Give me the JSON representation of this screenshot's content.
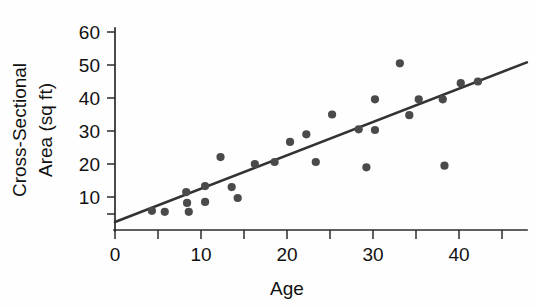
{
  "chart_data": {
    "type": "scatter",
    "title": "",
    "xlabel": "Age",
    "ylabel": "Cross-Sectional Area (sq ft)",
    "ylabel_line1": "Cross-Sectional",
    "ylabel_line2": "Area (sq ft)",
    "xlim": [
      0,
      48
    ],
    "ylim": [
      0,
      65
    ],
    "grid": false,
    "legend": null,
    "x_ticks_labeled": [
      0,
      10,
      20,
      30,
      40
    ],
    "x_ticks_minor": [
      5,
      15,
      25,
      35,
      45
    ],
    "y_ticks_labeled": [
      10,
      20,
      30,
      40,
      50,
      60
    ],
    "y_ticks_minor": [
      5
    ],
    "marker_color": "#4a4a4a",
    "line_color": "#333333",
    "axis_color": "#2b2b2b",
    "points": [
      {
        "x": 4.3,
        "y": 5.8
      },
      {
        "x": 5.8,
        "y": 5.5
      },
      {
        "x": 8.3,
        "y": 11.5
      },
      {
        "x": 8.4,
        "y": 8.2
      },
      {
        "x": 8.6,
        "y": 5.5
      },
      {
        "x": 10.5,
        "y": 13.3
      },
      {
        "x": 10.5,
        "y": 8.5
      },
      {
        "x": 12.3,
        "y": 22.1
      },
      {
        "x": 13.6,
        "y": 13.0
      },
      {
        "x": 14.3,
        "y": 9.7
      },
      {
        "x": 16.3,
        "y": 20.0
      },
      {
        "x": 18.6,
        "y": 20.6
      },
      {
        "x": 20.4,
        "y": 26.7
      },
      {
        "x": 22.3,
        "y": 29.0
      },
      {
        "x": 23.4,
        "y": 20.6
      },
      {
        "x": 25.3,
        "y": 35.0
      },
      {
        "x": 28.4,
        "y": 30.5
      },
      {
        "x": 29.3,
        "y": 19.0
      },
      {
        "x": 30.3,
        "y": 39.6
      },
      {
        "x": 30.3,
        "y": 30.3
      },
      {
        "x": 33.2,
        "y": 50.5
      },
      {
        "x": 34.3,
        "y": 34.8
      },
      {
        "x": 35.4,
        "y": 39.6
      },
      {
        "x": 38.2,
        "y": 39.6
      },
      {
        "x": 38.4,
        "y": 19.5
      },
      {
        "x": 40.3,
        "y": 44.5
      },
      {
        "x": 42.3,
        "y": 45.0
      }
    ],
    "trendline": {
      "type": "linear",
      "x_start": 0,
      "y_start": 2.4,
      "x_end": 48,
      "y_end": 50.8
    }
  },
  "axis": {
    "x_tick_labels": [
      "0",
      "10",
      "20",
      "30",
      "40"
    ],
    "y_tick_labels": [
      "10",
      "20",
      "30",
      "40",
      "50",
      "60"
    ]
  }
}
